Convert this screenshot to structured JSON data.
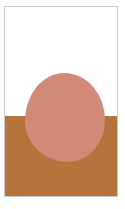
{
  "artwork": {
    "title": "Abstract Composition",
    "description": "Minimal abstract print: white upper field over an ochre-brown lower field, with a large rounded salmon-pink organic form straddling the horizon line.",
    "medium": "flat-color print",
    "orientation": "portrait"
  },
  "frame": {
    "border_color": "#c9c9c9",
    "paper_color": "#ffffff",
    "border_width_px": 1
  },
  "palette": {
    "sky_white": "#ffffff",
    "ground_brown": "#b5743c",
    "blob_pink": "#d18a77"
  },
  "composition": {
    "horizon_position_percent": 57.5,
    "sky_label": "upper white field",
    "ground_label": "lower ochre field",
    "blob_label": "central pink organic form",
    "blob_left_percent": 17.5,
    "blob_top_percent": 35.0,
    "blob_width_percent": 71.5,
    "blob_height_percent": 47.0
  }
}
